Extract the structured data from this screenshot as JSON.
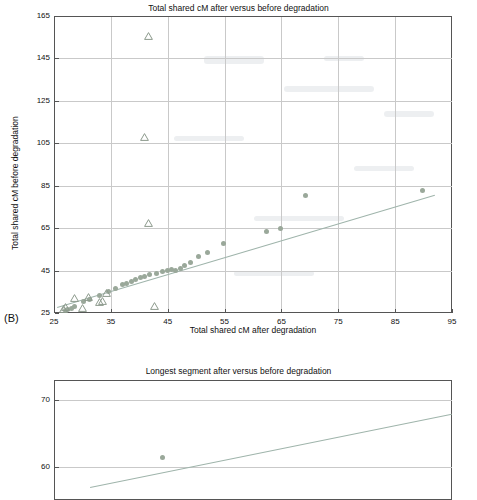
{
  "chart_data": [
    {
      "type": "scatter",
      "panel": "B",
      "title": "Total shared cM after versus before degradation",
      "xlabel": "Total shared cM after degradation",
      "ylabel": "Total shared cM before degradation",
      "xlim": [
        25,
        95
      ],
      "ylim": [
        25,
        165
      ],
      "xticks": [
        25,
        35,
        45,
        55,
        65,
        75,
        85,
        95
      ],
      "yticks": [
        25,
        45,
        65,
        85,
        105,
        125,
        145,
        165
      ],
      "grid": true,
      "legend": "none",
      "series": [
        {
          "name": "circles",
          "marker": "circle",
          "color": "#9aa89a",
          "points": [
            [
              27.0,
              26.0
            ],
            [
              27.3,
              26.6
            ],
            [
              28.0,
              27.2
            ],
            [
              28.6,
              28.0
            ],
            [
              30.2,
              30.6
            ],
            [
              31.2,
              31.5
            ],
            [
              33.0,
              33.4
            ],
            [
              34.6,
              35.2
            ],
            [
              35.8,
              36.6
            ],
            [
              37.0,
              38.4
            ],
            [
              37.8,
              39.0
            ],
            [
              38.6,
              40.0
            ],
            [
              39.4,
              41.0
            ],
            [
              40.2,
              41.6
            ],
            [
              41.0,
              42.0
            ],
            [
              41.8,
              43.0
            ],
            [
              43.0,
              43.4
            ],
            [
              44.0,
              44.6
            ],
            [
              45.0,
              45.0
            ],
            [
              45.6,
              45.4
            ],
            [
              46.4,
              45.2
            ],
            [
              47.2,
              46.0
            ],
            [
              48.0,
              47.4
            ],
            [
              49.0,
              49.0
            ],
            [
              50.4,
              51.4
            ],
            [
              52.0,
              53.6
            ],
            [
              54.8,
              57.8
            ],
            [
              62.4,
              63.4
            ],
            [
              64.8,
              64.6
            ],
            [
              69.2,
              80.4
            ],
            [
              89.8,
              82.6
            ]
          ]
        },
        {
          "name": "triangles",
          "marker": "triangle-open",
          "color": "#8c9a8c",
          "points": [
            [
              26.6,
              26.2
            ],
            [
              27.0,
              27.4
            ],
            [
              28.6,
              31.4
            ],
            [
              30.0,
              27.0
            ],
            [
              31.0,
              32.0
            ],
            [
              33.0,
              29.6
            ],
            [
              33.6,
              30.2
            ],
            [
              34.2,
              33.8
            ],
            [
              41.6,
              155.0
            ],
            [
              41.0,
              107.6
            ],
            [
              41.6,
              67.0
            ],
            [
              42.6,
              27.6
            ]
          ]
        }
      ],
      "fit_line": {
        "x": [
          25.5,
          92.0
        ],
        "y": [
          28.0,
          81.0
        ],
        "color": "#9fb4ab"
      }
    },
    {
      "type": "scatter",
      "title": "Longest segment after versus before degradation",
      "xlabel": "",
      "ylabel": "",
      "yticks": [
        60,
        70
      ],
      "grid": true,
      "legend": "none",
      "series": [
        {
          "name": "circles",
          "marker": "circle",
          "color": "#9aa89a",
          "points": [
            [
              88.0,
              61.4
            ]
          ]
        }
      ],
      "fit_line": {
        "x": [
          86.0,
          96.0
        ],
        "y": [
          57.0,
          68.0
        ],
        "color": "#9fb4ab"
      }
    }
  ],
  "chart1": {
    "title": "Total shared cM after versus before degradation",
    "xlabel": "Total shared cM after degradation",
    "ylabel": "Total shared cM before degradation",
    "panel_letter": "(B)",
    "yticks": [
      "165",
      "145",
      "125",
      "105",
      "85",
      "65",
      "45",
      "25"
    ],
    "xticks": [
      "25",
      "35",
      "45",
      "55",
      "65",
      "75",
      "85",
      "95"
    ]
  },
  "chart2": {
    "title": "Longest segment after versus before degradation",
    "yticks": [
      "70",
      "60"
    ]
  }
}
